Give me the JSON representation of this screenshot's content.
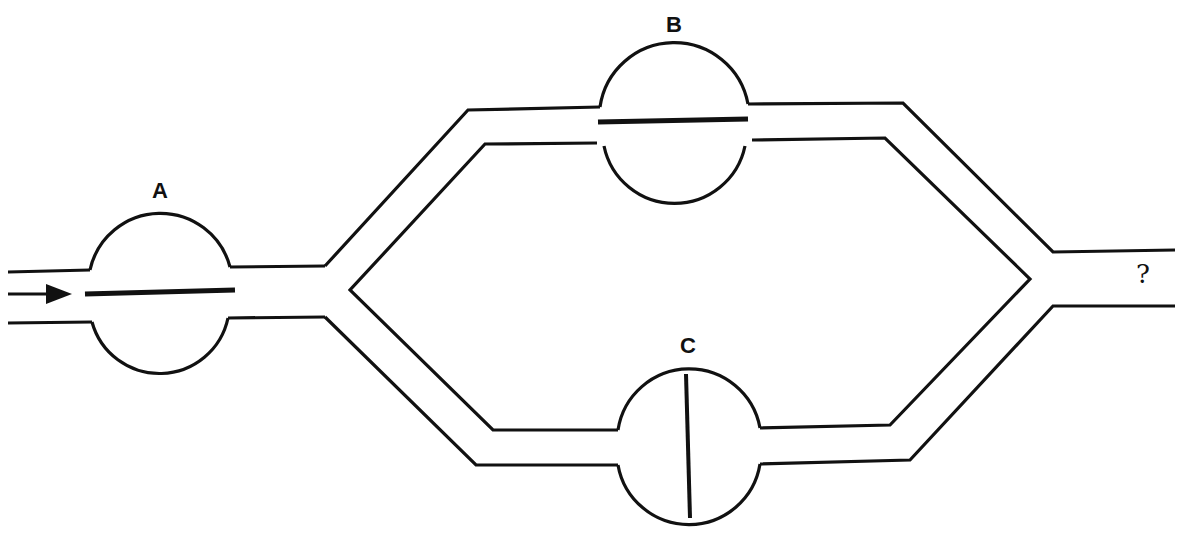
{
  "diagram": {
    "type": "flow network with three valves/membranes",
    "flow_direction": "left-to-right",
    "inlet_arrow": "arrow-right",
    "outlet_label": "?",
    "colors": {
      "stroke": "#111111",
      "background": "#ffffff"
    },
    "chambers": [
      {
        "id": "A",
        "label": "A",
        "membrane_orientation": "horizontal",
        "position": "inlet"
      },
      {
        "id": "B",
        "label": "B",
        "membrane_orientation": "horizontal",
        "position": "upper branch"
      },
      {
        "id": "C",
        "label": "C",
        "membrane_orientation": "vertical",
        "position": "lower branch"
      }
    ]
  }
}
